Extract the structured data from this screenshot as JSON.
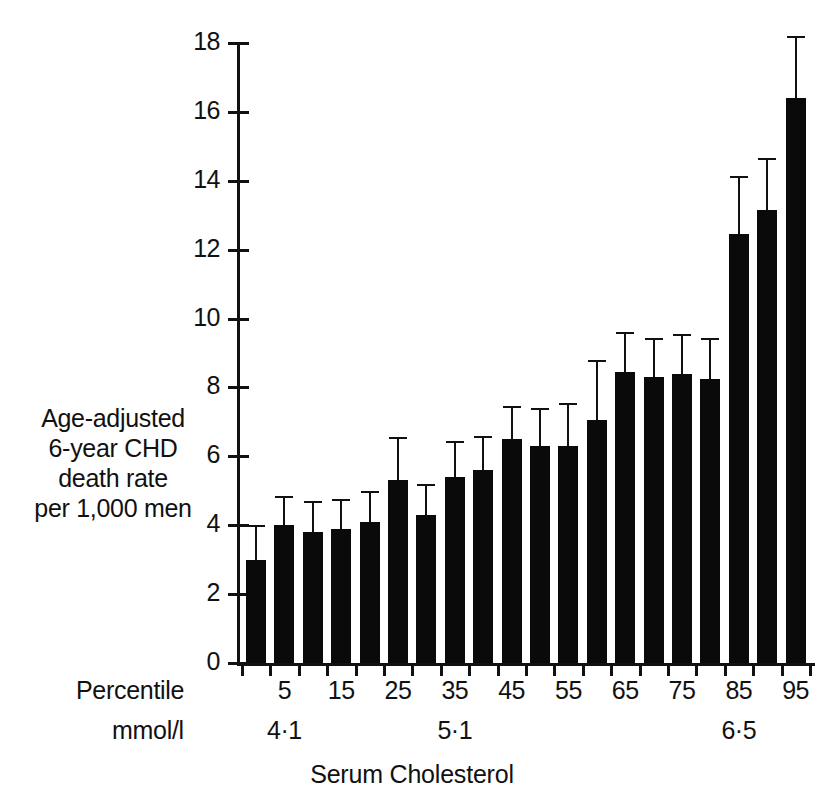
{
  "chart_data": {
    "type": "bar",
    "title": "",
    "xlabel": "Serum Cholesterol",
    "ylabel": "Age-adjusted 6-year CHD death rate per 1,000 men",
    "ylabel_lines": [
      "Age-adjusted",
      "6-year CHD",
      "death rate",
      "per 1,000 men"
    ],
    "ylim": [
      0,
      18
    ],
    "ytick_step": 2,
    "yticks": [
      "0",
      "2",
      "4",
      "6",
      "8",
      "10",
      "12",
      "14",
      "16",
      "18"
    ],
    "grid": false,
    "legend": "none",
    "categories": [
      "1",
      "2",
      "3",
      "4",
      "5",
      "6",
      "7",
      "8",
      "9",
      "10",
      "11",
      "12",
      "13",
      "14",
      "15",
      "16",
      "17",
      "18",
      "19",
      "20"
    ],
    "values": [
      3.0,
      4.0,
      3.8,
      3.9,
      4.1,
      5.3,
      4.3,
      5.4,
      5.6,
      6.5,
      6.3,
      6.3,
      7.05,
      8.45,
      8.3,
      8.4,
      8.25,
      12.45,
      13.15,
      16.4
    ],
    "error_upper": [
      4.0,
      4.85,
      4.7,
      4.75,
      5.0,
      6.55,
      5.2,
      6.45,
      6.6,
      7.45,
      7.4,
      7.55,
      8.8,
      9.6,
      9.45,
      9.55,
      9.45,
      14.15,
      14.65,
      18.2
    ],
    "x_rows": [
      {
        "name": "Percentile",
        "label": "Percentile",
        "ticks": [
          {
            "value": "5",
            "bar_index": 1
          },
          {
            "value": "15",
            "bar_index": 3
          },
          {
            "value": "25",
            "bar_index": 5
          },
          {
            "value": "35",
            "bar_index": 7
          },
          {
            "value": "45",
            "bar_index": 9
          },
          {
            "value": "55",
            "bar_index": 11
          },
          {
            "value": "65",
            "bar_index": 13
          },
          {
            "value": "75",
            "bar_index": 15
          },
          {
            "value": "85",
            "bar_index": 17
          },
          {
            "value": "95",
            "bar_index": 19
          }
        ]
      },
      {
        "name": "mmol/l",
        "label": "mmol/l",
        "ticks": [
          {
            "value": "4·1",
            "bar_index": 1
          },
          {
            "value": "5·1",
            "bar_index": 7
          },
          {
            "value": "6·5",
            "bar_index": 17
          }
        ]
      }
    ],
    "colors": {
      "bar": "#0a0a0a",
      "axis": "#111111",
      "background": "#ffffff",
      "text": "#111111"
    }
  }
}
